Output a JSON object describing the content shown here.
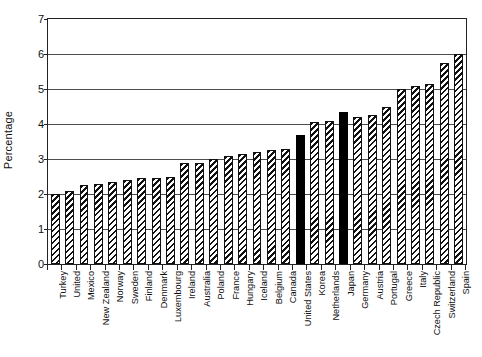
{
  "chart_data": {
    "type": "bar",
    "title": "",
    "xlabel": "",
    "ylabel": "Percentage",
    "ylim": [
      0,
      7
    ],
    "yticks": [
      0,
      1,
      2,
      3,
      4,
      5,
      6,
      7
    ],
    "grid": true,
    "legend": false,
    "categories": [
      "Turkey",
      "United",
      "Mexico",
      "New Zealand",
      "Norway",
      "Sweden",
      "Finland",
      "Denmark",
      "Luxembourg",
      "Ireland",
      "Australia",
      "Poland",
      "France",
      "Hungary",
      "Iceland",
      "Belgium",
      "Canada",
      "United States",
      "Korea",
      "Netherlands",
      "Japan",
      "Germany",
      "Austria",
      "Portugal",
      "Greece",
      "Italy",
      "Czech Republic",
      "Switzerland",
      "Spain"
    ],
    "values": [
      2.0,
      2.1,
      2.25,
      2.3,
      2.35,
      2.4,
      2.45,
      2.45,
      2.5,
      2.9,
      2.9,
      3.0,
      3.1,
      3.15,
      3.2,
      3.25,
      3.3,
      3.7,
      4.05,
      4.1,
      4.35,
      4.2,
      4.25,
      4.5,
      5.0,
      5.1,
      5.15,
      5.75,
      6.0
    ],
    "highlighted": [
      "United States",
      "Japan"
    ],
    "series_style": {
      "default_fill": "diagonal-hatch",
      "highlight_fill": "solid-black",
      "bar_outline": "#111111",
      "gridline_color": "#4c4c4c"
    }
  }
}
